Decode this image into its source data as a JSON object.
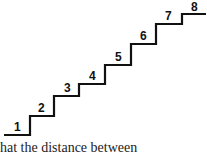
{
  "diagram": {
    "type": "staircase",
    "steps": [
      {
        "label": "1"
      },
      {
        "label": "2"
      },
      {
        "label": "3"
      },
      {
        "label": "4"
      },
      {
        "label": "5"
      },
      {
        "label": "6"
      },
      {
        "label": "7"
      },
      {
        "label": "8"
      }
    ],
    "line_color": "#111111"
  },
  "caption": {
    "text": "hat the distance between"
  }
}
